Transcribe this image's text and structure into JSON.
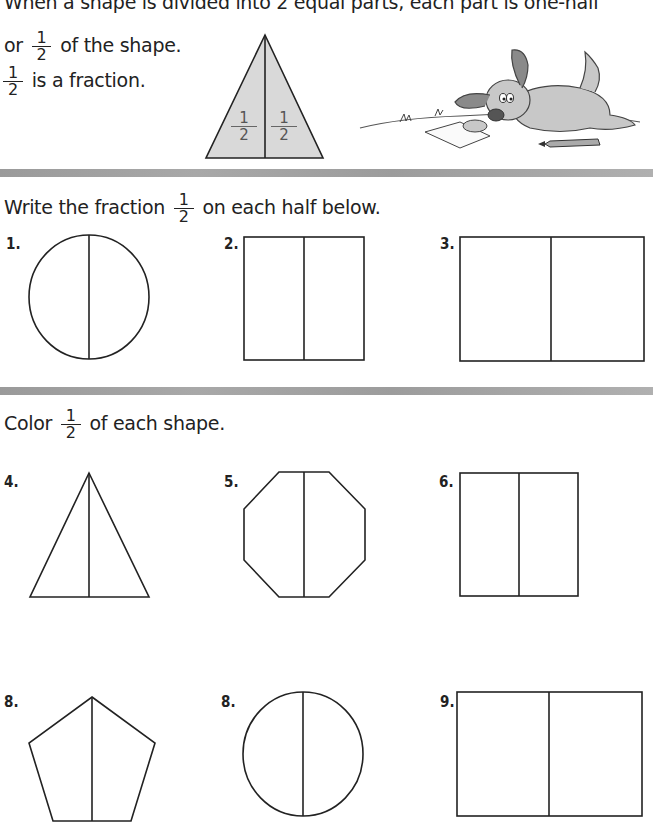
{
  "intro": {
    "line1": "When a shape is divided into 2 equal parts, each part is one-half",
    "line2_prefix": "or",
    "line2_suffix": "of the shape.",
    "line3_suffix": "is a fraction.",
    "fraction": {
      "numerator": "1",
      "denominator": "2"
    },
    "example_triangle": {
      "left_label": {
        "numerator": "1",
        "denominator": "2"
      },
      "right_label": {
        "numerator": "1",
        "denominator": "2"
      },
      "fill_color": "#d9d9d9"
    },
    "illustration": "cartoon-dog-with-pencil"
  },
  "section1": {
    "instruction_prefix": "Write the fraction",
    "instruction_suffix": "on each half below.",
    "fraction": {
      "numerator": "1",
      "denominator": "2"
    },
    "problems": [
      {
        "number": "1.",
        "shape": "circle"
      },
      {
        "number": "2.",
        "shape": "rectangle"
      },
      {
        "number": "3.",
        "shape": "rectangle"
      }
    ]
  },
  "section2": {
    "instruction_prefix": "Color",
    "instruction_suffix": "of each shape.",
    "fraction": {
      "numerator": "1",
      "denominator": "2"
    },
    "problems": [
      {
        "number": "4.",
        "shape": "triangle"
      },
      {
        "number": "5.",
        "shape": "octagon"
      },
      {
        "number": "6.",
        "shape": "rectangle"
      },
      {
        "number": "8.",
        "shape": "pentagon"
      },
      {
        "number": "8.",
        "shape": "circle"
      },
      {
        "number": "9.",
        "shape": "rectangle"
      }
    ]
  },
  "colors": {
    "divider_bar": "#a3a3a3",
    "line": "#222222",
    "example_fill": "#d9d9d9"
  }
}
